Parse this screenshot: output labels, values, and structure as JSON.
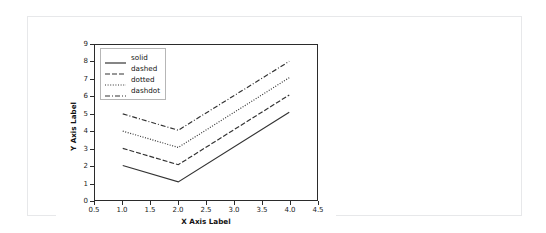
{
  "panel": {
    "background": "#ffffff",
    "border_color": "#e7e8ea"
  },
  "chart_data": {
    "type": "line",
    "title": "",
    "xlabel": "X Axis Label",
    "ylabel": "Y Axis Label",
    "xlim": [
      0.5,
      4.5
    ],
    "ylim": [
      0,
      9
    ],
    "xticks": [
      "0.5",
      "1.0",
      "1.5",
      "2.0",
      "2.5",
      "3.0",
      "3.5",
      "4.0",
      "4.5"
    ],
    "xtick_values": [
      0.5,
      1.0,
      1.5,
      2.0,
      2.5,
      3.0,
      3.5,
      4.0,
      4.5
    ],
    "yticks": [
      "0",
      "1",
      "2",
      "3",
      "4",
      "5",
      "6",
      "7",
      "8",
      "9"
    ],
    "ytick_values": [
      0,
      1,
      2,
      3,
      4,
      5,
      6,
      7,
      8,
      9
    ],
    "grid": false,
    "legend_position": "upper left",
    "line_color": "#333333",
    "x": [
      1.0,
      2.0,
      4.0
    ],
    "series": [
      {
        "name": "solid",
        "style": "solid",
        "dash": "none",
        "values": [
          2.0,
          1.05,
          5.1
        ]
      },
      {
        "name": "dashed",
        "style": "dashed",
        "dash": "5,2",
        "values": [
          3.0,
          2.05,
          6.1
        ]
      },
      {
        "name": "dotted",
        "style": "dotted",
        "dash": "1,1.6",
        "values": [
          4.0,
          3.05,
          7.1
        ]
      },
      {
        "name": "dashdot",
        "style": "dashdot",
        "dash": "5,2,1,2",
        "values": [
          5.0,
          4.05,
          8.05
        ]
      }
    ]
  },
  "legend": {
    "items": [
      {
        "label": "solid"
      },
      {
        "label": "dashed"
      },
      {
        "label": "dotted"
      },
      {
        "label": "dashdot"
      }
    ]
  }
}
